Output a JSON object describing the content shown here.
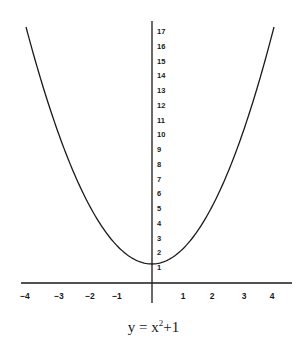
{
  "chart_data": {
    "type": "line",
    "equation": {
      "lhs": "y = x",
      "exp": "2",
      "rhs": "+1"
    },
    "xlabel": "",
    "ylabel": "",
    "x_ticks": [
      -4,
      -3,
      -2,
      -1,
      1,
      2,
      3,
      4
    ],
    "y_ticks": [
      1,
      2,
      3,
      4,
      5,
      6,
      7,
      8,
      9,
      10,
      11,
      12,
      13,
      14,
      15,
      16,
      17
    ],
    "xlim": [
      -4.3,
      4.7
    ],
    "ylim": [
      0,
      18
    ],
    "grid": false,
    "legend": null,
    "series": [
      {
        "name": "y = x^2 + 1",
        "x": [
          -4,
          -3.5,
          -3,
          -2.5,
          -2,
          -1.5,
          -1,
          -0.5,
          0,
          0.5,
          1,
          1.5,
          2,
          2.5,
          3,
          3.5,
          4
        ],
        "y": [
          17,
          13.25,
          10,
          7.25,
          5,
          3.25,
          2,
          1.25,
          1,
          1.25,
          2,
          3.25,
          5,
          7.25,
          10,
          13.25,
          17
        ]
      }
    ],
    "colors": {
      "line": "#1a1a1a",
      "axis": "#1a1a1a",
      "background": "#ffffff"
    }
  }
}
